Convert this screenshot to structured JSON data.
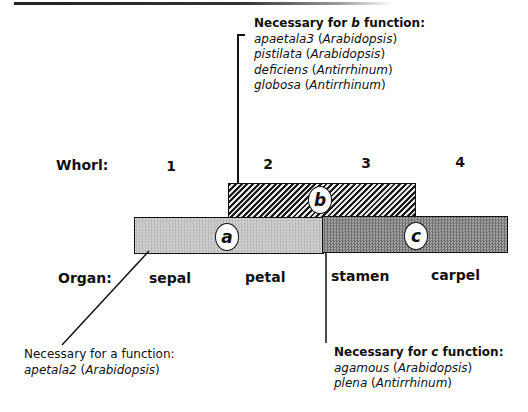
{
  "b_function": {
    "heading_prefix": "Necessary for ",
    "heading_letter": "b",
    "heading_suffix": " function:",
    "genes": [
      {
        "gene": "apaetala3",
        "species": "Arabidopsis"
      },
      {
        "gene": "pistilata",
        "species": "Arabidopsis"
      },
      {
        "gene": "deficiens",
        "species": "Antirrhinum"
      },
      {
        "gene": "globosa",
        "species": "Antirrhinum"
      }
    ]
  },
  "a_function": {
    "heading": "Necessary for a function:",
    "genes": [
      {
        "gene": "apetala2",
        "species": "Arabidopsis"
      }
    ]
  },
  "c_function": {
    "heading_prefix": "Necessary for ",
    "heading_letter": "c",
    "heading_suffix": " function:",
    "genes": [
      {
        "gene": "agamous",
        "species": "Arabidopsis"
      },
      {
        "gene": "plena",
        "species": "Antirrhinum"
      }
    ]
  },
  "whorl": {
    "label": "Whorl:",
    "numbers": [
      "1",
      "2",
      "3",
      "4"
    ]
  },
  "organ": {
    "label": "Organ:",
    "names": [
      "sepal",
      "petal",
      "stamen",
      "carpel"
    ]
  },
  "domains": {
    "a": {
      "label": "a",
      "whorls": [
        1,
        2
      ],
      "color": "#c8c8c8"
    },
    "b": {
      "label": "b",
      "whorls": [
        2,
        3
      ],
      "pattern": "diagonal-hatch"
    },
    "c": {
      "label": "c",
      "whorls": [
        3,
        4
      ],
      "color": "#8a8a8a"
    }
  },
  "punct": {
    "open": " (",
    "close": ")"
  }
}
